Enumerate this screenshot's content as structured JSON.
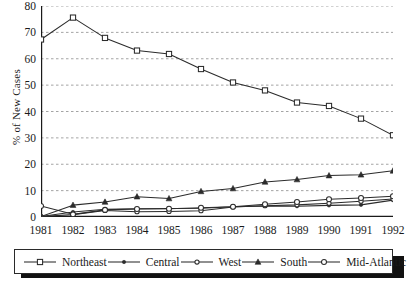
{
  "chart_data": {
    "type": "line",
    "title": "",
    "xlabel": "",
    "ylabel": "% of New Cases",
    "x": [
      1981,
      1982,
      1983,
      1984,
      1985,
      1986,
      1987,
      1988,
      1989,
      1990,
      1991,
      1992
    ],
    "categories": [
      "1981",
      "1982",
      "1983",
      "1984",
      "1985",
      "1986",
      "1987",
      "1988",
      "1989",
      "1990",
      "1991",
      "1992"
    ],
    "xlim": [
      1981,
      1992
    ],
    "ylim": [
      0,
      80
    ],
    "yticks": [
      0,
      10,
      20,
      30,
      40,
      50,
      60,
      70,
      80
    ],
    "ytick_labels": [
      "0",
      "10",
      "20",
      "30",
      "40",
      "50",
      "60",
      "70",
      "80"
    ],
    "grid": "horizontal-dashed",
    "legend_position": "bottom-box",
    "series": [
      {
        "name": "Northeast",
        "marker": "open-square",
        "values": [
          67.3,
          75.6,
          67.9,
          63.1,
          61.8,
          56.1,
          51.0,
          48.0,
          43.4,
          42.1,
          37.3,
          31.0
        ]
      },
      {
        "name": "Central",
        "marker": "filled-dot",
        "values": [
          0.2,
          1.9,
          2.9,
          3.1,
          3.2,
          3.3,
          3.9,
          4.2,
          4.1,
          4.4,
          4.6,
          6.4
        ]
      },
      {
        "name": "West",
        "marker": "open-circle-small",
        "values": [
          0.2,
          0.9,
          2.5,
          2.0,
          2.1,
          2.4,
          3.8,
          4.3,
          4.6,
          5.2,
          6.0,
          6.8
        ]
      },
      {
        "name": "South",
        "marker": "filled-triangle",
        "values": [
          0.2,
          4.5,
          5.7,
          7.7,
          7.0,
          9.7,
          10.8,
          13.3,
          14.2,
          15.7,
          16.0,
          17.5
        ]
      },
      {
        "name": "Mid-Atlantic",
        "marker": "open-circle",
        "values": [
          4.2,
          1.0,
          2.7,
          3.0,
          3.1,
          3.5,
          3.9,
          4.8,
          5.7,
          6.7,
          7.2,
          7.9
        ]
      }
    ]
  },
  "legend": {
    "items": [
      {
        "label": "Northeast",
        "marker": "open-square"
      },
      {
        "label": "Central",
        "marker": "filled-dot"
      },
      {
        "label": "West",
        "marker": "open-circle-small"
      },
      {
        "label": "South",
        "marker": "filled-triangle"
      },
      {
        "label": "Mid-Atlantic",
        "marker": "open-circle"
      }
    ]
  },
  "colors": {
    "line": "#2b2b2b",
    "grid": "#9a9a9a",
    "axis": "#1a1a1a",
    "background": "#ffffff"
  }
}
